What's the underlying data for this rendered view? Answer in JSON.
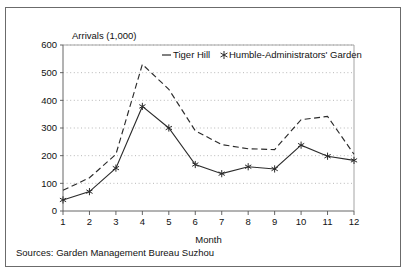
{
  "chart_data": {
    "type": "line",
    "title": "",
    "ylabel": "Arrivals (1,000)",
    "xlabel": "Month",
    "categories": [
      "1",
      "2",
      "3",
      "4",
      "5",
      "6",
      "7",
      "8",
      "9",
      "10",
      "11",
      "12"
    ],
    "x": [
      1,
      2,
      3,
      4,
      5,
      6,
      7,
      8,
      9,
      10,
      11,
      12
    ],
    "ylim": [
      0,
      600
    ],
    "xlim": [
      1,
      12
    ],
    "yticks": [
      "600",
      "500",
      "400",
      "300",
      "200",
      "100",
      "0"
    ],
    "ytick_values": [
      600,
      500,
      400,
      300,
      200,
      100,
      0
    ],
    "grid": "horizontal-dotted",
    "legend_position": "top-right-inside",
    "series": [
      {
        "name": "Tiger Hill",
        "style": "dashed",
        "marker": "none",
        "values": [
          75,
          120,
          205,
          530,
          440,
          290,
          240,
          225,
          222,
          330,
          342,
          205
        ]
      },
      {
        "name": "Humble-Administrators' Garden",
        "style": "solid",
        "marker": "star",
        "values": [
          40,
          70,
          155,
          378,
          300,
          168,
          135,
          160,
          152,
          238,
          198,
          183
        ]
      }
    ]
  },
  "legend": {
    "items": [
      {
        "label": "Tiger Hill",
        "marker": "dash-sample"
      },
      {
        "label": "Humble-Administrators' Garden",
        "marker": "star-sample"
      }
    ]
  },
  "axes": {
    "y_axis_title": "Arrivals (1,000)",
    "x_axis_title": "Month"
  },
  "footer": {
    "source": "Sources: Garden Management Bureau Suzhou"
  }
}
